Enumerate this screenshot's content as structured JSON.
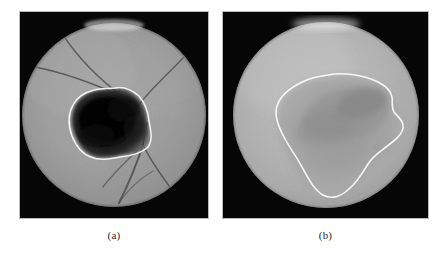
{
  "figure": {
    "background_color": "#ffffff",
    "panel_count": 2,
    "modality": "retinal fundus image",
    "annotation_type": "white segmentation contour outlining lesion region"
  },
  "panels": [
    {
      "id": "panel-a",
      "caption": "(a)",
      "name": "fluorescein-angiography-panel",
      "description": "Grayscale retinal angiogram with dark hypofluorescent lesion enclosed by a white contour, crossed by dark retinal vessels",
      "frame_color": "#060606",
      "disc_fill": "#9d9d9d",
      "lesion_fill": "#0d0d0d",
      "contour_color": "#f2f2f2",
      "vessel_color": "#4a4a4a",
      "disc": {
        "cx": 95,
        "cy": 104,
        "r": 92
      },
      "lesion_centroid": {
        "x": 92,
        "y": 110
      },
      "vessel_count": 5
    },
    {
      "id": "panel-b",
      "caption": "(b)",
      "name": "color-fundus-panel",
      "description": "Grayscale fundus photograph with a diffuse darker region enclosed by a white contour",
      "frame_color": "#060606",
      "disc_fill": "#b4b4b4",
      "lesion_fill": "#9a9a9a",
      "contour_color": "#f7f7f7",
      "disc": {
        "cx": 104,
        "cy": 104,
        "r": 93
      },
      "lesion_centroid": {
        "x": 118,
        "y": 120
      },
      "vessel_count": 0
    }
  ],
  "captions": {
    "a": "(a)",
    "b": "(b)"
  }
}
